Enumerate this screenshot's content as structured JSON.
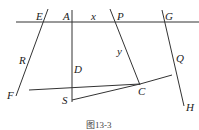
{
  "diagram": {
    "labels": {
      "E": "E",
      "A": "A",
      "x": "x",
      "P": "P",
      "G": "G",
      "R": "R",
      "D": "D",
      "y": "y",
      "Q": "Q",
      "C": "C",
      "S": "S",
      "F": "F",
      "H": "H"
    },
    "caption": "图13-3",
    "points": {
      "E": [
        44,
        22
      ],
      "A": [
        72,
        22
      ],
      "P": [
        116,
        22
      ],
      "G": [
        164,
        22
      ],
      "R": [
        29,
        91
      ],
      "D": [
        72,
        95
      ],
      "C": [
        140,
        85
      ],
      "Q": [
        172,
        74
      ],
      "S": [
        72,
        101
      ],
      "F": [
        17,
        93
      ],
      "H": [
        180,
        107
      ]
    }
  }
}
